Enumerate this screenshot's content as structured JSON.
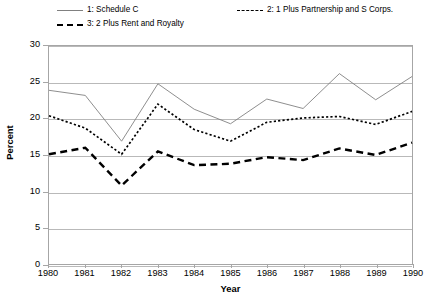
{
  "chart_data": {
    "type": "line",
    "title": "",
    "xlabel": "Year",
    "ylabel": "Percent",
    "x": [
      1980,
      1981,
      1982,
      1983,
      1984,
      1985,
      1986,
      1987,
      1988,
      1989,
      1990
    ],
    "xtick_labels": [
      "1980",
      "1981",
      "1982",
      "1983",
      "1984",
      "1985",
      "1986",
      "1987",
      "1988",
      "1989",
      "1990"
    ],
    "ytick_labels": [
      "0",
      "5",
      "10",
      "15",
      "20",
      "25",
      "30"
    ],
    "ytick_values": [
      0,
      5,
      10,
      15,
      20,
      25,
      30
    ],
    "ylim": [
      0,
      30
    ],
    "xlim": [
      1980,
      1990
    ],
    "grid": "horizontal",
    "legend_position": "above-plot",
    "series": [
      {
        "name": "1: Schedule C",
        "style": "solid",
        "color": "#808080",
        "values": [
          23.9,
          23.2,
          16.9,
          24.8,
          21.3,
          19.3,
          22.7,
          21.4,
          26.2,
          22.6,
          25.8
        ]
      },
      {
        "name": "2: 1 Plus Partnership and S Corps.",
        "style": "dotted",
        "color": "#000000",
        "values": [
          20.4,
          18.7,
          15.1,
          22.0,
          18.5,
          16.9,
          19.5,
          20.1,
          20.3,
          19.2,
          21.0
        ]
      },
      {
        "name": "3: 2 Plus Rent and Royalty",
        "style": "dashed",
        "color": "#000000",
        "values": [
          15.1,
          16.0,
          10.8,
          15.5,
          13.6,
          13.8,
          14.7,
          14.3,
          15.9,
          15.0,
          16.7
        ]
      }
    ]
  },
  "legend": {
    "entries": [
      {
        "label": "1: Schedule C",
        "style": "solid"
      },
      {
        "label": "2: 1 Plus Partnership and S Corps.",
        "style": "dotted"
      },
      {
        "label": "3: 2 Plus Rent and Royalty",
        "style": "dashed"
      }
    ]
  },
  "axes": {
    "x_title": "Year",
    "y_title": "Percent"
  }
}
